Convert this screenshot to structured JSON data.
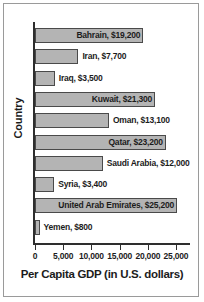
{
  "chart_data": {
    "type": "bar",
    "orientation": "horizontal",
    "title": "",
    "xlabel": "Per Capita GDP (in U.S. dollars)",
    "ylabel": "Country",
    "xlim": [
      0,
      27000
    ],
    "grid": false,
    "legend": null,
    "xticks": [
      {
        "value": 0,
        "label": "0"
      },
      {
        "value": 5000,
        "label": "5,000"
      },
      {
        "value": 10000,
        "label": "10,000"
      },
      {
        "value": 15000,
        "label": "15,000"
      },
      {
        "value": 20000,
        "label": "20,000"
      },
      {
        "value": 25000,
        "label": "25,000"
      }
    ],
    "categories": [
      "Bahrain",
      "Iran",
      "Iraq",
      "Kuwait",
      "Oman",
      "Qatar",
      "Saudi Arabia",
      "Syria",
      "United Arab Emirates",
      "Yemen"
    ],
    "values": [
      19200,
      7700,
      3500,
      21300,
      13100,
      23200,
      12000,
      3400,
      25200,
      800
    ],
    "bars": [
      {
        "label": "Bahrain, $19,200",
        "value": 19200,
        "label_inside": true
      },
      {
        "label": "Iran, $7,700",
        "value": 7700,
        "label_inside": false
      },
      {
        "label": "Iraq, $3,500",
        "value": 3500,
        "label_inside": false
      },
      {
        "label": "Kuwait, $21,300",
        "value": 21300,
        "label_inside": true
      },
      {
        "label": "Oman, $13,100",
        "value": 13100,
        "label_inside": false
      },
      {
        "label": "Qatar, $23,200",
        "value": 23200,
        "label_inside": true
      },
      {
        "label": "Saudi Arabia, $12,000",
        "value": 12000,
        "label_inside": false
      },
      {
        "label": "Syria, $3,400",
        "value": 3400,
        "label_inside": false
      },
      {
        "label": "United Arab Emirates, $25,200",
        "value": 25200,
        "label_inside": true
      },
      {
        "label": "Yemen, $800",
        "value": 800,
        "label_inside": false
      }
    ],
    "colors": {
      "bar_fill": "#b4b4b4",
      "bar_stroke": "#4a4a4a",
      "axis": "#2e2e2e",
      "text": "#1c1c1c",
      "frame": "#9a9a9a",
      "background": "#ffffff"
    }
  }
}
